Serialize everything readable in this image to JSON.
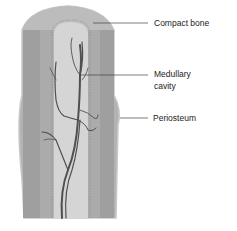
{
  "figure": {
    "labels": [
      {
        "id": "compact-bone",
        "text": "Compact bone"
      },
      {
        "id": "medullary-cavity",
        "text_line1": "Medullary",
        "text_line2": "cavity"
      },
      {
        "id": "periosteum",
        "text": "Periosteum"
      }
    ]
  },
  "colors": {
    "outer_bone": "#a9a9a9",
    "compact_dark": "#999999",
    "cap": "#bdbdbd",
    "medullary": "#d6d6d6",
    "vessel": "#555555",
    "leader_line": "#444444"
  }
}
